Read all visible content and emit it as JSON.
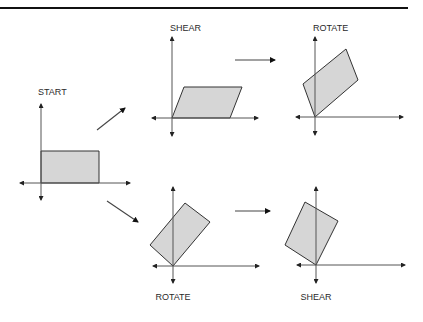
{
  "diagram": {
    "panels": [
      {
        "id": "start",
        "label": "START"
      },
      {
        "id": "shear-top",
        "label": "SHEAR"
      },
      {
        "id": "rotate-top",
        "label": "ROTATE"
      },
      {
        "id": "rotate-bottom",
        "label": "ROTATE"
      },
      {
        "id": "shear-bottom",
        "label": "SHEAR"
      }
    ],
    "flows": [
      {
        "from": "START",
        "to": "SHEAR"
      },
      {
        "from": "SHEAR",
        "to": "ROTATE"
      },
      {
        "from": "START",
        "to": "ROTATE"
      },
      {
        "from": "ROTATE",
        "to": "SHEAR"
      }
    ],
    "colors": {
      "fill": "#d6d6d6",
      "stroke": "#333333",
      "rule": "#111111"
    }
  }
}
